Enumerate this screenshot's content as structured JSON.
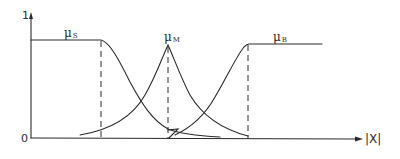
{
  "diagram": {
    "type": "fuzzy-membership-functions",
    "y_axis": {
      "top_label": "1",
      "origin_label": "0"
    },
    "x_axis": {
      "label": "|X|"
    },
    "colors": {
      "stroke": "#2a2a2a",
      "background": "#ffffff"
    },
    "functions": [
      {
        "id": "small",
        "symbol": "μ",
        "subscript": "S",
        "shape": "Z-shaped (plateau at 1, then falls)"
      },
      {
        "id": "medium",
        "symbol": "μ",
        "subscript": "M",
        "shape": "peaked (cusp) bell"
      },
      {
        "id": "big",
        "symbol": "μ",
        "subscript": "B",
        "shape": "S-shaped (rises, then plateau at 1)"
      }
    ],
    "dashed_guides": 3
  }
}
